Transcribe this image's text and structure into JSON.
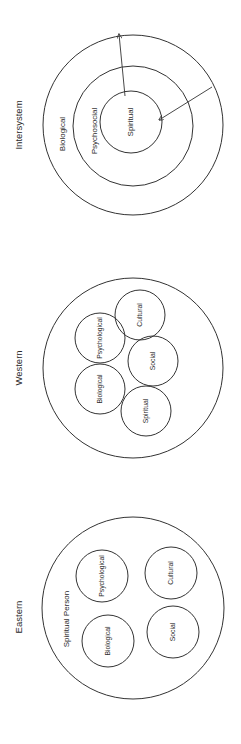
{
  "figure": {
    "orientation": "rotated 90 degrees counter-clockwise",
    "line_color": "#333333",
    "text_color": "#2a2a2a",
    "background": "#ffffff"
  },
  "panels": [
    {
      "id": "intersystem",
      "title": "Intersystem",
      "title_pos": [
        19,
        125
      ],
      "layout": "concentric",
      "circles": [
        {
          "label": "Biological",
          "cx": 133,
          "cy": 125,
          "r": 90,
          "label_pos": [
            63,
            134
          ]
        },
        {
          "label": "Psychosocial",
          "cx": 133,
          "cy": 126,
          "r": 60,
          "label_pos": [
            95,
            131
          ]
        },
        {
          "label": "Spiritual",
          "cx": 131,
          "cy": 122,
          "r": 31,
          "label_pos": [
            131,
            122
          ]
        }
      ],
      "arrows": [
        {
          "from": [
            125,
            96
          ],
          "to": [
            119,
            34
          ]
        },
        {
          "from": [
            212,
            87
          ],
          "to": [
            159,
            120
          ]
        }
      ]
    },
    {
      "id": "western",
      "title": "Western",
      "title_pos": [
        19,
        368
      ],
      "layout": "overlapping",
      "outer": {
        "cx": 133,
        "cy": 368,
        "r": 90
      },
      "circles": [
        {
          "label": "Psychological",
          "cx": 100,
          "cy": 338,
          "r": 25,
          "label_pos": [
            100,
            338
          ]
        },
        {
          "label": "Biological",
          "cx": 100,
          "cy": 389,
          "r": 25,
          "label_pos": [
            100,
            389
          ]
        },
        {
          "label": "Cultural",
          "cx": 140,
          "cy": 315,
          "r": 25,
          "label_pos": [
            140,
            315
          ]
        },
        {
          "label": "Social",
          "cx": 153,
          "cy": 361,
          "r": 25,
          "label_pos": [
            153,
            361
          ]
        },
        {
          "label": "Spiritual",
          "cx": 146,
          "cy": 411,
          "r": 25,
          "label_pos": [
            146,
            411
          ]
        }
      ]
    },
    {
      "id": "eastern",
      "title": "Eastern",
      "title_pos": [
        19,
        617
      ],
      "layout": "separate",
      "outer": {
        "cx": 133,
        "cy": 608,
        "r": 91
      },
      "outer_label": {
        "text": "Spiritual Person",
        "pos": [
          67,
          619
        ]
      },
      "circles": [
        {
          "label": "Psychological",
          "cx": 102,
          "cy": 576,
          "r": 26,
          "label_pos": [
            102,
            576
          ]
        },
        {
          "label": "Cultural",
          "cx": 171,
          "cy": 573,
          "r": 26,
          "label_pos": [
            171,
            573
          ]
        },
        {
          "label": "Biological",
          "cx": 108,
          "cy": 641,
          "r": 26,
          "label_pos": [
            108,
            641
          ]
        },
        {
          "label": "Social",
          "cx": 173,
          "cy": 632,
          "r": 26,
          "label_pos": [
            173,
            632
          ]
        }
      ]
    }
  ]
}
